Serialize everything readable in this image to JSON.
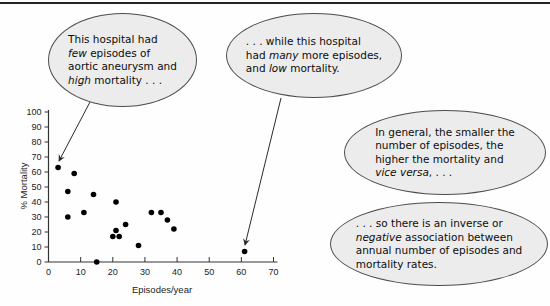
{
  "figure": {
    "top_rule_color": "#232323",
    "background": "#fefefe",
    "bubble_fill": "#ececec",
    "bubble_stroke": "#4d4d4d",
    "arrow_color": "#2a2a2a"
  },
  "bubbles": [
    {
      "id": "few-episodes-high-mortality",
      "segments": [
        {
          "text": "This hospital had"
        },
        {
          "br": true
        },
        {
          "text": "few",
          "italic": true
        },
        {
          "text": " episodes of"
        },
        {
          "br": true
        },
        {
          "text": "aortic aneurysm and"
        },
        {
          "br": true
        },
        {
          "text": "high",
          "italic": true
        },
        {
          "text": " mortality . . ."
        }
      ]
    },
    {
      "id": "many-episodes-low-mortality",
      "segments": [
        {
          "text": ". . . while this hospital"
        },
        {
          "br": true
        },
        {
          "text": "had "
        },
        {
          "text": "many",
          "italic": true
        },
        {
          "text": " more episodes,"
        },
        {
          "br": true
        },
        {
          "text": "and "
        },
        {
          "text": "low",
          "italic": true
        },
        {
          "text": " mortality."
        }
      ]
    },
    {
      "id": "general-pattern",
      "segments": [
        {
          "text": "In general, the smaller the"
        },
        {
          "br": true
        },
        {
          "text": "number of episodes, the"
        },
        {
          "br": true
        },
        {
          "text": "higher the mortality and"
        },
        {
          "br": true
        },
        {
          "text": "vice versa",
          "italic": true
        },
        {
          "text": ", . . ."
        }
      ]
    },
    {
      "id": "inverse-association",
      "segments": [
        {
          "text": ". . . so there is an inverse or"
        },
        {
          "br": true
        },
        {
          "text": "negative",
          "italic": true
        },
        {
          "text": " association between"
        },
        {
          "br": true
        },
        {
          "text": "annual number of episodes and"
        },
        {
          "br": true
        },
        {
          "text": "mortality rates."
        }
      ]
    }
  ],
  "annotation_arrows": [
    {
      "points_to": "low-volume-high-mortality-point",
      "from_px": [
        90,
        102
      ],
      "to_px": [
        59,
        161
      ]
    },
    {
      "points_to": "high-volume-low-mortality-point",
      "from_px": [
        281,
        98
      ],
      "to_px": [
        245,
        245
      ]
    }
  ],
  "chart_data": {
    "type": "scatter",
    "title": "",
    "xlabel": "Episodes/year",
    "ylabel": "% Mortality",
    "xlim": [
      0,
      70
    ],
    "ylim": [
      0,
      100
    ],
    "xticks": [
      0,
      10,
      20,
      30,
      40,
      50,
      60,
      70
    ],
    "yticks": [
      0,
      10,
      20,
      30,
      40,
      50,
      60,
      70,
      80,
      90,
      100
    ],
    "grid": false,
    "legend": false,
    "marker_color": "#000000",
    "axis_color": "#333333",
    "points": [
      [
        3,
        63
      ],
      [
        8,
        59
      ],
      [
        6,
        47
      ],
      [
        14,
        45
      ],
      [
        6,
        30
      ],
      [
        11,
        33
      ],
      [
        21,
        40
      ],
      [
        15,
        0
      ],
      [
        24,
        25
      ],
      [
        21,
        21
      ],
      [
        20,
        17
      ],
      [
        22,
        17
      ],
      [
        28,
        11
      ],
      [
        32,
        33
      ],
      [
        35,
        33
      ],
      [
        37,
        28
      ],
      [
        39,
        22
      ],
      [
        61,
        7
      ]
    ]
  }
}
